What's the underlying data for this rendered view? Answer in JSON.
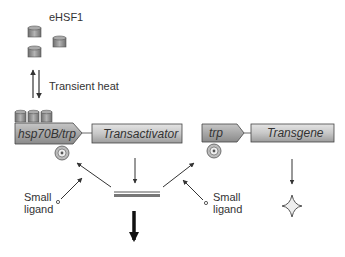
{
  "labels": {
    "ehsf1": "eHSF1",
    "transient_heat": "Transient heat",
    "promoter_left": "hsp70B/trp",
    "transactivator": "Transactivator",
    "promoter_right": "trp",
    "transgene": "Transgene",
    "small_ligand_left_1": "Small",
    "small_ligand_left_2": "ligand",
    "small_ligand_right_1": "Small",
    "small_ligand_right_2": "ligand"
  },
  "icons": {
    "hsf_trimer": "cylinder-icon",
    "operator": "target-circle-icon",
    "ligand": "small-circle-icon",
    "product": "four-point-star-icon"
  },
  "colors": {
    "box_fill_dark": "#9a9a9a",
    "box_fill_light": "#d4d4d4",
    "stroke": "#444444",
    "cylinder": "#8c8c8c"
  }
}
